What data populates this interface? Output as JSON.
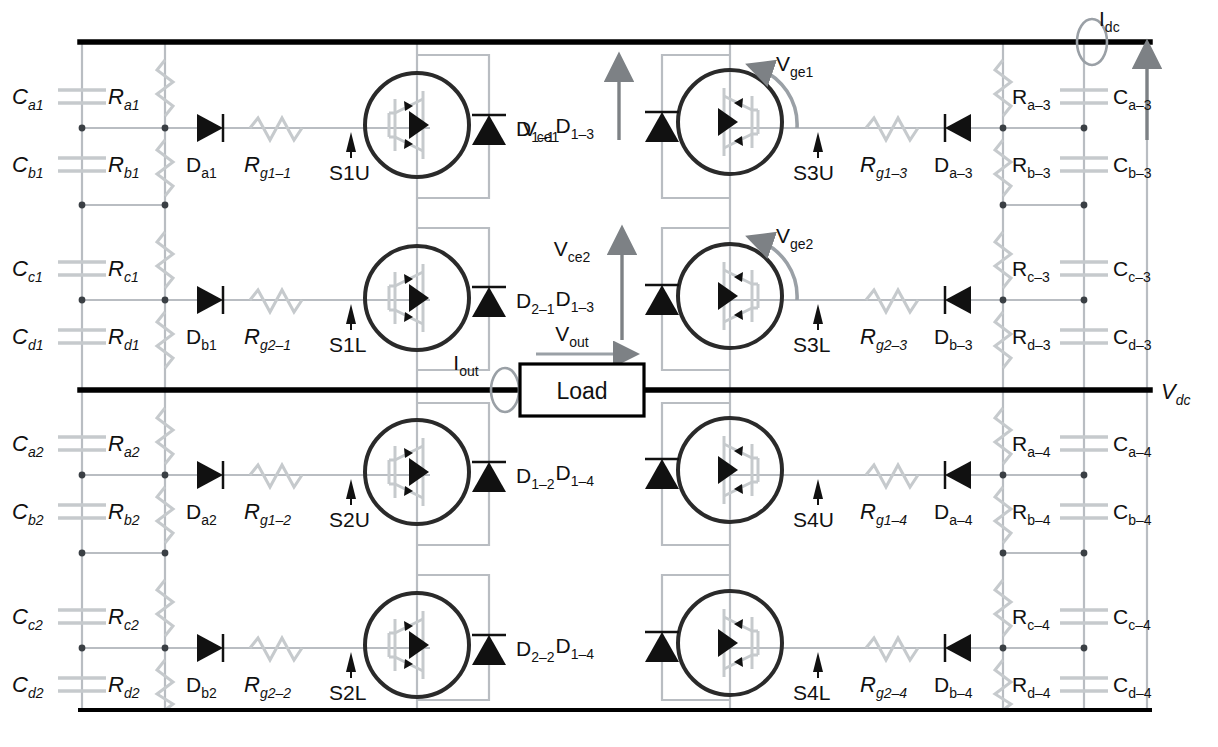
{
  "diagram": {
    "load_label": "Load",
    "colors": {
      "bus": "#000000",
      "wire": "#b9bdc2",
      "device": "#1a1a1a",
      "text": "#111111",
      "probe": "#9aa0a6",
      "arrow": "#7d8185"
    }
  },
  "measurements": {
    "idc": {
      "base": "I",
      "sub": "dc"
    },
    "iout": {
      "base": "I",
      "sub": "out"
    },
    "vout": {
      "base": "V",
      "sub": "out"
    },
    "vdc": {
      "base": "V",
      "sub": "dc"
    },
    "vce1": {
      "base": "V",
      "sub": "ce1"
    },
    "vce2": {
      "base": "V",
      "sub": "ce2"
    },
    "vge1": {
      "base": "V",
      "sub": "ge1"
    },
    "vge2": {
      "base": "V",
      "sub": "ge2"
    }
  },
  "left_capacitors": [
    {
      "base": "C",
      "sub": "a1"
    },
    {
      "base": "C",
      "sub": "b1"
    },
    {
      "base": "C",
      "sub": "c1"
    },
    {
      "base": "C",
      "sub": "d1"
    },
    {
      "base": "C",
      "sub": "a2"
    },
    {
      "base": "C",
      "sub": "b2"
    },
    {
      "base": "C",
      "sub": "c2"
    },
    {
      "base": "C",
      "sub": "d2"
    }
  ],
  "left_resistors": [
    {
      "base": "R",
      "sub": "a1"
    },
    {
      "base": "R",
      "sub": "b1"
    },
    {
      "base": "R",
      "sub": "c1"
    },
    {
      "base": "R",
      "sub": "d1"
    },
    {
      "base": "R",
      "sub": "a2"
    },
    {
      "base": "R",
      "sub": "b2"
    },
    {
      "base": "R",
      "sub": "c2"
    },
    {
      "base": "R",
      "sub": "d2"
    }
  ],
  "right_capacitors": [
    {
      "base": "C",
      "sub": "a–3"
    },
    {
      "base": "C",
      "sub": "b–3"
    },
    {
      "base": "C",
      "sub": "c–3"
    },
    {
      "base": "C",
      "sub": "d–3"
    },
    {
      "base": "C",
      "sub": "a–4"
    },
    {
      "base": "C",
      "sub": "b–4"
    },
    {
      "base": "C",
      "sub": "c–4"
    },
    {
      "base": "C",
      "sub": "d–4"
    }
  ],
  "right_resistors": [
    {
      "base": "R",
      "sub": "a–3"
    },
    {
      "base": "R",
      "sub": "b–3"
    },
    {
      "base": "R",
      "sub": "c–3"
    },
    {
      "base": "R",
      "sub": "d–3"
    },
    {
      "base": "R",
      "sub": "a–4"
    },
    {
      "base": "R",
      "sub": "b–4"
    },
    {
      "base": "R",
      "sub": "c–4"
    },
    {
      "base": "R",
      "sub": "d–4"
    }
  ],
  "left_diodes": [
    {
      "base": "D",
      "sub": "a1"
    },
    {
      "base": "D",
      "sub": "b1"
    },
    {
      "base": "D",
      "sub": "a2"
    },
    {
      "base": "D",
      "sub": "b2"
    }
  ],
  "right_diodes": [
    {
      "base": "D",
      "sub": "a–3"
    },
    {
      "base": "D",
      "sub": "b–3"
    },
    {
      "base": "D",
      "sub": "a–4"
    },
    {
      "base": "D",
      "sub": "b–4"
    }
  ],
  "left_gate_resistors": [
    {
      "base": "R",
      "sub": "g1–1"
    },
    {
      "base": "R",
      "sub": "g2–1"
    },
    {
      "base": "R",
      "sub": "g1–2"
    },
    {
      "base": "R",
      "sub": "g2–2"
    }
  ],
  "right_gate_resistors": [
    {
      "base": "R",
      "sub": "g1–3"
    },
    {
      "base": "R",
      "sub": "g2–3"
    },
    {
      "base": "R",
      "sub": "g1–4"
    },
    {
      "base": "R",
      "sub": "g2–4"
    }
  ],
  "switch_labels": {
    "s1u": "S1U",
    "s1l": "S1L",
    "s2u": "S2U",
    "s2l": "S2L",
    "s3u": "S3U",
    "s3l": "S3L",
    "s4u": "S4U",
    "s4l": "S4L"
  },
  "freewheel_diodes": {
    "left_top": {
      "base": "D",
      "sub": "1–1"
    },
    "left_mid": {
      "base": "D",
      "sub": "2–1"
    },
    "left_low": {
      "base": "D",
      "sub": "1–2"
    },
    "left_bot": {
      "base": "D",
      "sub": "2–2"
    },
    "right_top": {
      "base": "D",
      "sub": "1–3"
    },
    "right_mid": {
      "base": "D",
      "sub": "1–3"
    },
    "right_low": {
      "base": "D",
      "sub": "1–4"
    },
    "right_bot": {
      "base": "D",
      "sub": "1–4"
    }
  }
}
